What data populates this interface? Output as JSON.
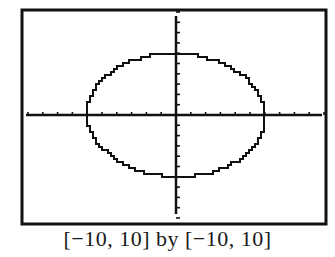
{
  "chart_data": {
    "type": "line",
    "title": "",
    "xlabel": "",
    "ylabel": "",
    "xlim": [
      -10,
      10
    ],
    "ylim": [
      -10,
      10
    ],
    "xscl": 1,
    "yscl": 1,
    "grid": false,
    "axes": true,
    "series": [
      {
        "name": "circle",
        "description": "Pixelated circle centered at origin, radius about 6 (calculator graph of x^2 + y^2 = 36)",
        "center": [
          0,
          0
        ],
        "radius": 6,
        "points_x": [
          6,
          5.7,
          5,
          4,
          3,
          2,
          1,
          0,
          -1,
          -2,
          -3,
          -4,
          -5,
          -5.7,
          -6,
          -5.7,
          -5,
          -4,
          -3,
          -2,
          -1,
          0,
          1,
          2,
          3,
          4,
          5,
          5.7,
          6
        ],
        "points_y": [
          0,
          1.9,
          3.3,
          4.5,
          5.2,
          5.7,
          5.9,
          6,
          5.9,
          5.7,
          5.2,
          4.5,
          3.3,
          1.9,
          0,
          -1.9,
          -3.3,
          -4.5,
          -5.2,
          -5.7,
          -5.9,
          -6,
          -5.9,
          -5.7,
          -5.2,
          -4.5,
          -3.3,
          -1.9,
          0
        ]
      }
    ],
    "window_caption": "[−10, 10] by [−10, 10]"
  },
  "caption": "[−10, 10] by [−10, 10]"
}
